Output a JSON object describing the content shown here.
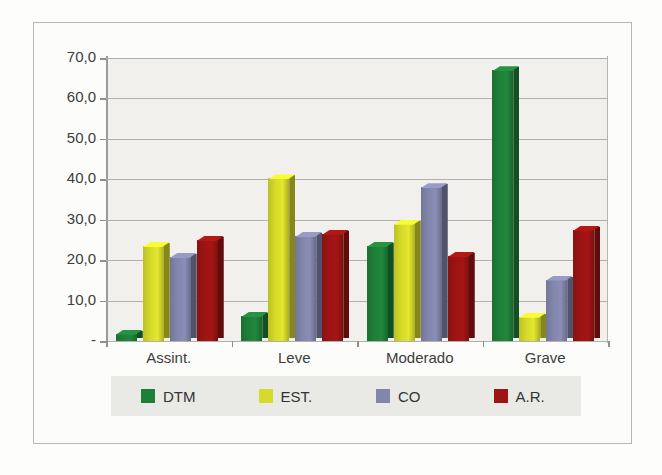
{
  "chart_data": {
    "type": "bar",
    "title": "",
    "subtitle": "",
    "xlabel": "",
    "ylabel": "",
    "categories": [
      "Assint.",
      "Leve",
      "Moderado",
      "Grave"
    ],
    "series": [
      {
        "name": "DTM",
        "color": "#1f7f39",
        "values": [
          1.8,
          6.2,
          23.5,
          67.0
        ]
      },
      {
        "name": "EST.",
        "color": "#d6da2a",
        "values": [
          23.5,
          40.2,
          29.0,
          6.0
        ]
      },
      {
        "name": "CO",
        "color": "#8286ab",
        "values": [
          20.8,
          26.0,
          38.0,
          15.2
        ]
      },
      {
        "name": "A.R.",
        "color": "#9c1414",
        "values": [
          25.0,
          26.5,
          21.0,
          27.5
        ]
      }
    ],
    "ylim": [
      0,
      70
    ],
    "ytick_values": [
      0,
      10,
      20,
      30,
      40,
      50,
      60,
      70
    ],
    "ytick_labels": [
      "-",
      "10,0",
      "20,0",
      "30,0",
      "40,0",
      "50,0",
      "60,0",
      "70,0"
    ],
    "grid": true,
    "legend_position": "bottom",
    "decimal_separator": ","
  },
  "legend": {
    "items": [
      {
        "label": "DTM",
        "color": "#1f7f39"
      },
      {
        "label": "EST.",
        "color": "#d6da2a"
      },
      {
        "label": "CO",
        "color": "#8286ab"
      },
      {
        "label": "A.R.",
        "color": "#9c1414"
      }
    ]
  },
  "axis": {
    "y_labels": [
      "70,0",
      "60,0",
      "50,0",
      "40,0",
      "30,0",
      "20,0",
      "10,0",
      "-"
    ],
    "x_labels": [
      "Assint.",
      "Leve",
      "Moderado",
      "Grave"
    ]
  },
  "colors": {
    "plot_background": "#f1f0ec",
    "frame_border": "#b9b7ae",
    "gridline": "#b0b0ad",
    "legend_background": "#e9e9e5",
    "text": "#3d3d3d"
  }
}
